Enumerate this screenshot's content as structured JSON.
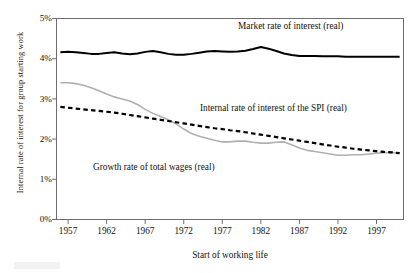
{
  "chart_data": {
    "type": "line",
    "title": "",
    "xlabel": "Start of working life",
    "ylabel": "Internal rate of interest for group starting work",
    "xlim": [
      1955.5,
      2000.5
    ],
    "ylim": [
      0,
      5
    ],
    "grid": false,
    "legend_position": "inline-annotations",
    "xticks": [
      "1957",
      "1962",
      "1967",
      "1972",
      "1977",
      "1982",
      "1987",
      "1992",
      "1997"
    ],
    "xtick_values": [
      1957,
      1962,
      1967,
      1972,
      1977,
      1982,
      1987,
      1992,
      1997
    ],
    "yticks": [
      "0%",
      "1%",
      "2%",
      "3%",
      "4%",
      "5%"
    ],
    "ytick_values": [
      0,
      1,
      2,
      3,
      4,
      5
    ],
    "x": [
      1956,
      1957,
      1958,
      1959,
      1960,
      1961,
      1962,
      1963,
      1964,
      1965,
      1966,
      1967,
      1968,
      1969,
      1970,
      1971,
      1972,
      1973,
      1974,
      1975,
      1976,
      1977,
      1978,
      1979,
      1980,
      1981,
      1982,
      1983,
      1984,
      1985,
      1986,
      1987,
      1988,
      1989,
      1990,
      1991,
      1992,
      1993,
      1994,
      1995,
      1996,
      1997,
      1998,
      1999,
      2000
    ],
    "series": [
      {
        "name": "Market rate of interest (real)",
        "style": "solid-black",
        "color": "#000000",
        "values": [
          4.16,
          4.17,
          4.16,
          4.14,
          4.12,
          4.12,
          4.14,
          4.16,
          4.13,
          4.11,
          4.13,
          4.17,
          4.19,
          4.16,
          4.12,
          4.1,
          4.1,
          4.12,
          4.15,
          4.18,
          4.19,
          4.18,
          4.17,
          4.18,
          4.2,
          4.24,
          4.29,
          4.25,
          4.19,
          4.13,
          4.09,
          4.07,
          4.07,
          4.07,
          4.06,
          4.06,
          4.06,
          4.05,
          4.05,
          4.05,
          4.05,
          4.05,
          4.05,
          4.05,
          4.05
        ]
      },
      {
        "name": "Internal rate of interest of the SPI (real)",
        "style": "dashed-black",
        "color": "#000000",
        "values": [
          2.8,
          2.78,
          2.76,
          2.74,
          2.72,
          2.7,
          2.68,
          2.66,
          2.63,
          2.6,
          2.57,
          2.54,
          2.51,
          2.48,
          2.45,
          2.42,
          2.39,
          2.36,
          2.33,
          2.3,
          2.27,
          2.25,
          2.22,
          2.2,
          2.17,
          2.14,
          2.11,
          2.08,
          2.05,
          2.02,
          1.99,
          1.96,
          1.93,
          1.9,
          1.87,
          1.84,
          1.81,
          1.79,
          1.76,
          1.74,
          1.72,
          1.7,
          1.68,
          1.67,
          1.65
        ]
      },
      {
        "name": "Growth rate of total wages (real)",
        "style": "solid-gray",
        "color": "#b0b0b0",
        "values": [
          3.4,
          3.4,
          3.38,
          3.34,
          3.28,
          3.2,
          3.12,
          3.05,
          3.0,
          2.95,
          2.86,
          2.74,
          2.64,
          2.56,
          2.48,
          2.38,
          2.25,
          2.14,
          2.07,
          2.02,
          1.97,
          1.93,
          1.93,
          1.95,
          1.95,
          1.92,
          1.9,
          1.9,
          1.92,
          1.93,
          1.86,
          1.78,
          1.72,
          1.69,
          1.66,
          1.63,
          1.6,
          1.6,
          1.61,
          1.61,
          1.63,
          1.65,
          1.66,
          1.66,
          1.66
        ]
      }
    ]
  },
  "axis": {
    "ylabel": "Internal rate of interest for group starting work",
    "xlabel": "Start of working life"
  },
  "annotations": {
    "market": "Market rate of interest (real)",
    "spi": "Internal rate of interest of the SPI (real)",
    "wages": "Growth rate of total wages (real)"
  }
}
